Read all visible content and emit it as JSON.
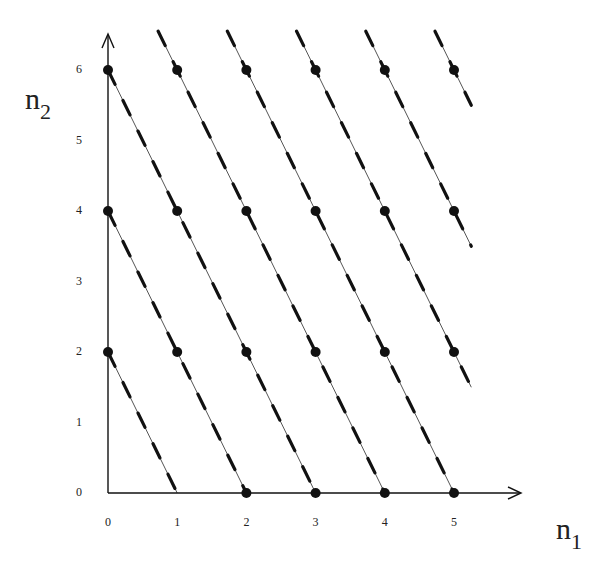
{
  "diagram": {
    "axes": {
      "x_label": "n",
      "x_sub": "1",
      "y_label": "n",
      "y_sub": "2",
      "x_ticks": [
        "0",
        "1",
        "2",
        "3",
        "4",
        "5"
      ],
      "y_ticks": [
        "0",
        "1",
        "2",
        "3",
        "4",
        "5",
        "6"
      ]
    },
    "lattice_points": [
      [
        0,
        2
      ],
      [
        0,
        4
      ],
      [
        0,
        6
      ],
      [
        1,
        2
      ],
      [
        1,
        4
      ],
      [
        1,
        6
      ],
      [
        2,
        0
      ],
      [
        2,
        2
      ],
      [
        2,
        4
      ],
      [
        2,
        6
      ],
      [
        3,
        0
      ],
      [
        3,
        2
      ],
      [
        3,
        4
      ],
      [
        3,
        6
      ],
      [
        4,
        0
      ],
      [
        4,
        2
      ],
      [
        4,
        4
      ],
      [
        4,
        6
      ],
      [
        5,
        0
      ],
      [
        5,
        2
      ],
      [
        5,
        4
      ],
      [
        5,
        6
      ]
    ],
    "lines": {
      "description": "dashed lines n2 = 2(k - n1)",
      "k_values": [
        1,
        2,
        3,
        4,
        5,
        6,
        7,
        8
      ]
    },
    "colors": {
      "ink": "#111111",
      "thin": "#555555"
    }
  }
}
